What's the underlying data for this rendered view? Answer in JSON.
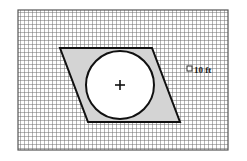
{
  "figure": {
    "kind": "geometry-diagram",
    "background_color": "#ffffff",
    "grid": {
      "x": 18,
      "y": 10,
      "width": 210,
      "height": 140,
      "cell_size": 4,
      "line_color": "#4a4a4a",
      "minor_line_color": "#6e6e6e",
      "fill_color": "#ffffff",
      "border_color": "#555555",
      "columns": 52,
      "rows": 35
    },
    "parallelogram": {
      "name": "shaded-parallelogram",
      "fill_color": "#d4d4d4",
      "stroke_color": "#111111",
      "stroke_width": 2,
      "points": "60,48 152,48 180,122 88,122",
      "vertices": [
        {
          "x": 60,
          "y": 48
        },
        {
          "x": 152,
          "y": 48
        },
        {
          "x": 180,
          "y": 122
        },
        {
          "x": 88,
          "y": 122
        }
      ]
    },
    "circle": {
      "name": "inscribed-circle",
      "center_x": 120,
      "center_y": 85,
      "radius": 34,
      "fill_color": "#ffffff",
      "stroke_color": "#111111",
      "stroke_width": 2
    },
    "center_mark": {
      "name": "circle-center-cross",
      "x": 120,
      "y": 85,
      "arm_length": 5,
      "color": "#111111",
      "stroke_width": 1.6
    },
    "scale_label": {
      "marker_shape": "square",
      "marker_x": 187,
      "marker_y": 66,
      "marker_size": 5,
      "marker_fill": "#ffffff",
      "marker_stroke": "#333333",
      "text": "10 ft",
      "text_x": 194,
      "text_y": 73,
      "text_color": "#1a1a1a"
    }
  }
}
